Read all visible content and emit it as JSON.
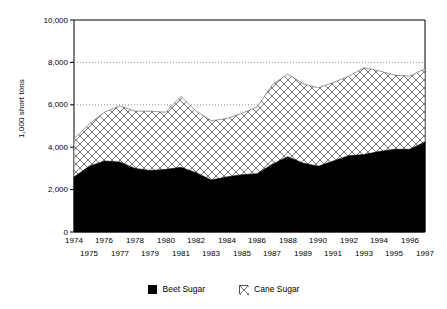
{
  "chart_data": {
    "type": "area",
    "stacked": true,
    "title": "",
    "subtitle": "",
    "xlabel": "",
    "ylabel": "1,000 short tons",
    "x": [
      1974,
      1975,
      1976,
      1977,
      1978,
      1979,
      1980,
      1981,
      1982,
      1983,
      1984,
      1985,
      1986,
      1987,
      1988,
      1989,
      1990,
      1991,
      1992,
      1993,
      1994,
      1995,
      1996,
      1997
    ],
    "xtick_labels_top": [
      "1974",
      "1976",
      "1978",
      "1980",
      "1982",
      "1984",
      "1986",
      "1988",
      "1990",
      "1992",
      "1994",
      "1996"
    ],
    "xtick_labels_bottom": [
      "1975",
      "1977",
      "1979",
      "1981",
      "1983",
      "1985",
      "1987",
      "1989",
      "1991",
      "1993",
      "1995",
      "1997"
    ],
    "ytick_labels": [
      "10,000",
      "8,000",
      "6,000",
      "4,000",
      "2,000",
      "0"
    ],
    "ytick_values": [
      10000,
      8000,
      6000,
      4000,
      2000,
      0
    ],
    "ylim": [
      0,
      10000
    ],
    "xlim": [
      1974,
      1997
    ],
    "grid": "horizontal-dotted",
    "gridlines_at": [
      8000,
      6000
    ],
    "legend_position": "bottom-center",
    "series": [
      {
        "name": "Beet Sugar",
        "fill": "solid-black",
        "color": "#000000",
        "values": [
          2600,
          3100,
          3350,
          3300,
          3000,
          2900,
          2950,
          3050,
          2800,
          2450,
          2600,
          2700,
          2750,
          3200,
          3550,
          3250,
          3100,
          3350,
          3600,
          3650,
          3800,
          3900,
          3900,
          4250
        ]
      },
      {
        "name": "Cane Sugar",
        "fill": "cross-hatch",
        "color": "#ffffff",
        "values": [
          1800,
          2000,
          2300,
          2650,
          2700,
          2800,
          2700,
          3350,
          2900,
          2800,
          2750,
          2900,
          3150,
          3750,
          3900,
          3750,
          3700,
          3700,
          3750,
          4100,
          3800,
          3500,
          3450,
          3450
        ]
      }
    ],
    "totals": [
      4400,
      5100,
      5650,
      5950,
      5700,
      5700,
      5650,
      6400,
      5700,
      5250,
      5350,
      5600,
      5900,
      6950,
      7450,
      7000,
      6800,
      7050,
      7350,
      7750,
      7600,
      7400,
      7350,
      7700
    ]
  },
  "legend": {
    "entries": [
      {
        "label": "Beet Sugar",
        "swatch": "solid-black-square-icon"
      },
      {
        "label": "Cane Sugar",
        "swatch": "cross-hatch-square-icon"
      }
    ]
  }
}
